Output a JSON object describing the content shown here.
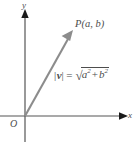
{
  "figure": {
    "background_color": "#ffffff",
    "axis_color": "#555555",
    "vector_color": "#8c8c8c",
    "text_color": "#4d4d4d"
  },
  "axes": {
    "x_label": "x",
    "y_label": "y",
    "origin_label": "O",
    "x_arrow_icon": "arrow-right-icon",
    "y_arrow_icon": "arrow-up-icon"
  },
  "vector": {
    "arrow_icon": "vector-arrow-icon",
    "point_label": "P(a, b)",
    "start": [
      25,
      116
    ],
    "end": [
      72,
      32
    ]
  },
  "formula": {
    "magnitude_bar_left": "|",
    "magnitude_symbol": "v",
    "magnitude_bar_right": "|",
    "equals": "=",
    "radical_sign": "√",
    "term_a": "a",
    "exponent_a": "2",
    "operator": "+",
    "term_b": "b",
    "exponent_b": "2",
    "full_text": "|v| = √(a² + b²)"
  }
}
